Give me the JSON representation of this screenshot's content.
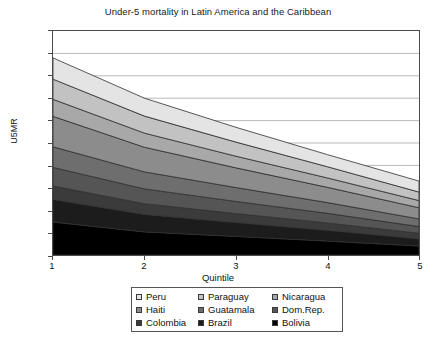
{
  "chart_data": {
    "type": "area",
    "stacked": true,
    "title": "Under-5 mortality in Latin America and the Caribbean",
    "xlabel": "Quintile",
    "ylabel": "U5MR",
    "x": [
      1,
      2,
      3,
      4,
      5
    ],
    "xticklabels": [
      "1",
      "2",
      "3",
      "4",
      "5"
    ],
    "xlim": [
      1,
      5
    ],
    "ylim": [
      0,
      1000
    ],
    "yticks": [
      0,
      100,
      200,
      300,
      400,
      500,
      600,
      700,
      800,
      900,
      1000
    ],
    "yticklabels": [
      "0",
      "100",
      "200",
      "300",
      "400",
      "500",
      "600",
      "700",
      "800",
      "900",
      "1000"
    ],
    "grid": "horizontal",
    "legend_position": "below",
    "series": [
      {
        "name": "Bolivia",
        "values": [
          147,
          103,
          83,
          62,
          40
        ],
        "color": "#000000",
        "stack_order": 1
      },
      {
        "name": "Brazil",
        "values": [
          101,
          78,
          62,
          48,
          32
        ],
        "color": "#1c1c1c",
        "stack_order": 2
      },
      {
        "name": "Colombia",
        "values": [
          60,
          48,
          40,
          33,
          25
        ],
        "color": "#3b3b3b",
        "stack_order": 3
      },
      {
        "name": "Dom.Rep.",
        "values": [
          83,
          66,
          54,
          43,
          30
        ],
        "color": "#555555",
        "stack_order": 4
      },
      {
        "name": "Guatamala",
        "values": [
          92,
          76,
          62,
          48,
          34
        ],
        "color": "#6e6e6e",
        "stack_order": 5
      },
      {
        "name": "Haiti",
        "values": [
          136,
          110,
          88,
          68,
          50
        ],
        "color": "#8c8c8c",
        "stack_order": 6
      },
      {
        "name": "Nicaragua",
        "values": [
          76,
          63,
          52,
          42,
          32
        ],
        "color": "#a8a8a8",
        "stack_order": 7
      },
      {
        "name": "Paraguay",
        "values": [
          90,
          76,
          63,
          50,
          38
        ],
        "color": "#c2c2c2",
        "stack_order": 8
      },
      {
        "name": "Peru",
        "values": [
          95,
          80,
          66,
          54,
          49
        ],
        "color": "#e4e4e4",
        "stack_order": 9
      }
    ],
    "totals": [
      880,
      700,
      570,
      448,
      330
    ]
  },
  "legend": {
    "rows": [
      [
        {
          "label": "Peru",
          "color": "#e4e4e4",
          "swatch_name": "legend-swatch-peru"
        },
        {
          "label": "Paraguay",
          "color": "#c2c2c2",
          "swatch_name": "legend-swatch-paraguay"
        },
        {
          "label": "Nicaragua",
          "color": "#a8a8a8",
          "swatch_name": "legend-swatch-nicaragua"
        }
      ],
      [
        {
          "label": "Haiti",
          "color": "#8c8c8c",
          "swatch_name": "legend-swatch-haiti"
        },
        {
          "label": "Guatamala",
          "color": "#6e6e6e",
          "swatch_name": "legend-swatch-guatamala"
        },
        {
          "label": "Dom.Rep.",
          "color": "#555555",
          "swatch_name": "legend-swatch-domrep"
        }
      ],
      [
        {
          "label": "Colombia",
          "color": "#3b3b3b",
          "swatch_name": "legend-swatch-colombia"
        },
        {
          "label": "Brazil",
          "color": "#1c1c1c",
          "swatch_name": "legend-swatch-brazil"
        },
        {
          "label": "Bolivia",
          "color": "#000000",
          "swatch_name": "legend-swatch-bolivia"
        }
      ]
    ]
  },
  "style": {
    "axis_color": "#4a4a4a",
    "grid_color": "#b9b9b9",
    "band_edge_color": "#2f2f2f",
    "plot_background": "#ffffff"
  }
}
